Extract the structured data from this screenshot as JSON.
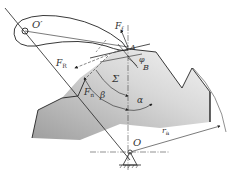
{
  "diagram": {
    "title": "",
    "labels": {
      "pivot_lever": "O′",
      "pivot_cam": "O",
      "contact_point": "A",
      "point_b": "B",
      "force_f": "F",
      "force_f_sub": "f",
      "force_r": "F",
      "force_r_sub": "R",
      "force_n": "F",
      "force_n_sub": "n",
      "angle_phi": "φ",
      "angle_beta": "β",
      "angle_sigma": "Σ",
      "angle_alpha": "α",
      "radius": "r",
      "radius_sub": "a"
    },
    "colors": {
      "line": "#222222",
      "fill_light": "#e8e8e8",
      "fill_dark": "#a8a8a8",
      "label": "#333333"
    }
  }
}
